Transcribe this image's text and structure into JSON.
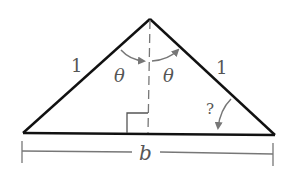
{
  "diagram": {
    "type": "isosceles-triangle",
    "side_left_label": "1",
    "side_right_label": "1",
    "angle_left_label": "θ",
    "angle_right_label": "θ",
    "base_angle_label": "?",
    "base_label": "b",
    "right_angle_marker": true,
    "colors": {
      "triangle": "#111111",
      "annotations": "#777777"
    }
  }
}
